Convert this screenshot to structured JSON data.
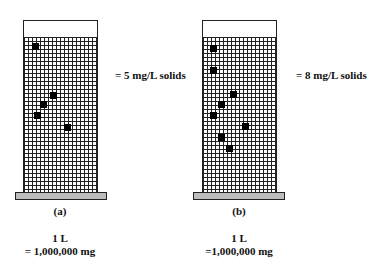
{
  "panels": [
    {
      "id": "a",
      "caption": "(a)",
      "legend": "= 5 mg/L solids",
      "volume_line1": "1 L",
      "volume_line2": "= 1,000,000 mg",
      "solid_count": 5
    },
    {
      "id": "b",
      "caption": "(b)",
      "legend": "= 8 mg/L solids",
      "volume_line1": "1 L",
      "volume_line2": "=1,000,000 mg",
      "solid_count": 8
    }
  ],
  "colors": {
    "grid_line": "#222222",
    "solid": "#000000",
    "base": "#bdbdbd",
    "background": "#ffffff"
  }
}
